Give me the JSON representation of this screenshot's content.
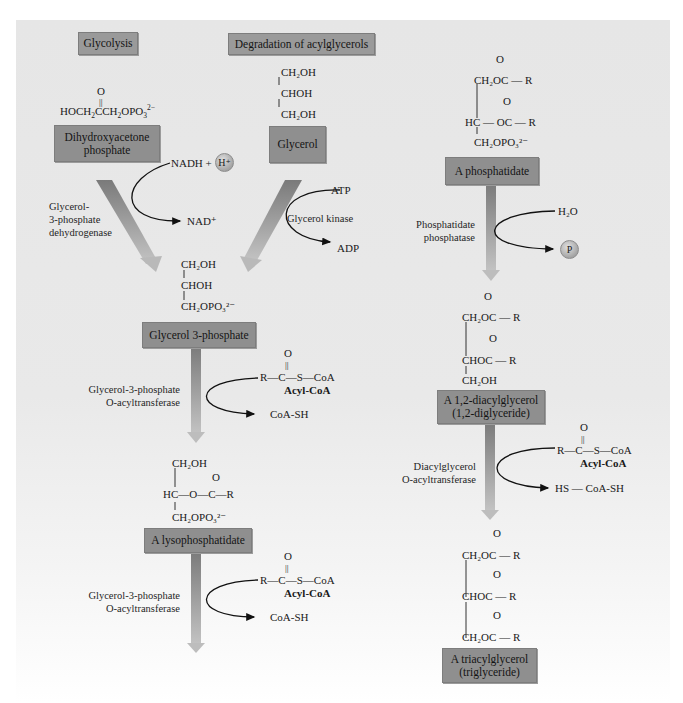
{
  "colors": {
    "panel_bg": "#e7e7e7",
    "box_fill": "#8f8f8f",
    "arrow_fill": "#8a8a8a",
    "text": "#1a1a1a"
  },
  "headers": {
    "glycolysis": "Glycolysis",
    "degradation": "Degradation of acylglycerols"
  },
  "compounds": {
    "dhap": {
      "label_line1": "Dihydroxyacetone",
      "label_line2": "phosphate",
      "formula_o": "O",
      "formula_a": "HOCH",
      "formula_b": "2",
      "formula_c": "CCH",
      "formula_d": "2",
      "formula_e": "OPO",
      "formula_f": "3",
      "formula_g": "2−"
    },
    "glycerol": {
      "label": "Glycerol",
      "line1": "CH₂OH",
      "line2": "CHOH",
      "line3": "CH₂OH"
    },
    "glycerol_3_phosphate": {
      "label": "Glycerol 3-phosphate",
      "line1": "CH₂OH",
      "line2": "CHOH",
      "line3": "CH₂OPO₃²⁻"
    },
    "lysophosphatidate": {
      "label": "A lysophosphatidate",
      "line1": "CH₂OH",
      "o_top": "O",
      "line2": "HC—O—C—R",
      "line3": "CH₂OPO₃²⁻"
    },
    "phosphatidate": {
      "label": "A phosphatidate",
      "o1": "O",
      "line1": "CH₂OC — R",
      "o2": "O",
      "line2": "HC — OC — R",
      "line3": "CH₂OPO₃²⁻"
    },
    "diacylglycerol": {
      "label_line1": "A 1,2-diacylglycerol",
      "label_line2": "(1,2-diglyceride)",
      "o1": "O",
      "line1": "CH₂OC — R",
      "o2": "O",
      "line2": "CHOC — R",
      "line3": "CH₂OH"
    },
    "triacylglycerol": {
      "label_line1": "A triacylglycerol",
      "label_line2": "(triglyceride)",
      "o1": "O",
      "line1": "CH₂OC — R",
      "o2": "O",
      "line2": "CHOC — R",
      "o3": "O",
      "line3": "CH₂OC — R"
    }
  },
  "enzymes": {
    "g3p_dehydrogenase_1": "Glycerol-",
    "g3p_dehydrogenase_2": "3-phosphate",
    "g3p_dehydrogenase_3": "dehydrogenase",
    "glycerol_kinase": "Glycerol kinase",
    "g3p_acyltransferase_1_line1": "Glycerol-3-phosphate",
    "g3p_acyltransferase_1_line2": "O-acyltransferase",
    "g3p_acyltransferase_2_line1": "Glycerol-3-phosphate",
    "g3p_acyltransferase_2_line2": "O-acyltransferase",
    "phosphatidate_phosphatase_line1": "Phosphatidate",
    "phosphatidate_phosphatase_line2": "phosphatase",
    "dag_acyltransferase_line1": "Diacylglycerol",
    "dag_acyltransferase_line2": "O-acyltransferase"
  },
  "cofactors": {
    "nadh": "NADH +",
    "h_plus": "H⁺",
    "nad_plus": "NAD⁺",
    "atp": "ATP",
    "adp": "ADP",
    "h2o": "H₂O",
    "pi": "P",
    "acyl_coa_o": "O",
    "acyl_coa_formula": "R—C—S—CoA",
    "acyl_coa_label": "Acyl-CoA",
    "coa_sh": "CoA-SH",
    "hs_coa_sh": "HS — CoA-SH"
  }
}
